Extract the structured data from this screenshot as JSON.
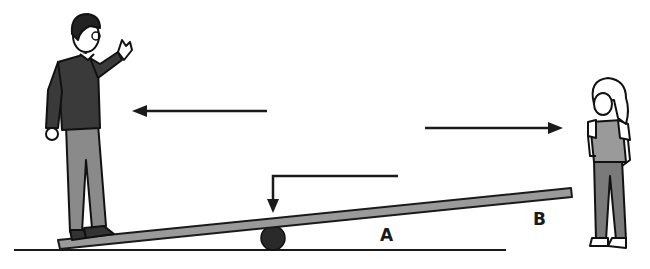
{
  "diagram": {
    "labels": {
      "a": "A",
      "b": "B"
    },
    "figures": {
      "man": "man-standing-on-low-end-waving",
      "girl": "girl-standing-right"
    },
    "arrows": [
      {
        "id": "arrow-left",
        "direction": "left"
      },
      {
        "id": "arrow-right",
        "direction": "right"
      },
      {
        "id": "arrow-down",
        "direction": "down"
      }
    ],
    "colors": {
      "line": "#1a1a1a",
      "beam": "#9a9a9a",
      "sweater": "#3a3a3a",
      "trousers": "#8a8a8a",
      "girl_vest": "#9a9a9a",
      "girl_trousers": "#7a7a7a"
    }
  }
}
